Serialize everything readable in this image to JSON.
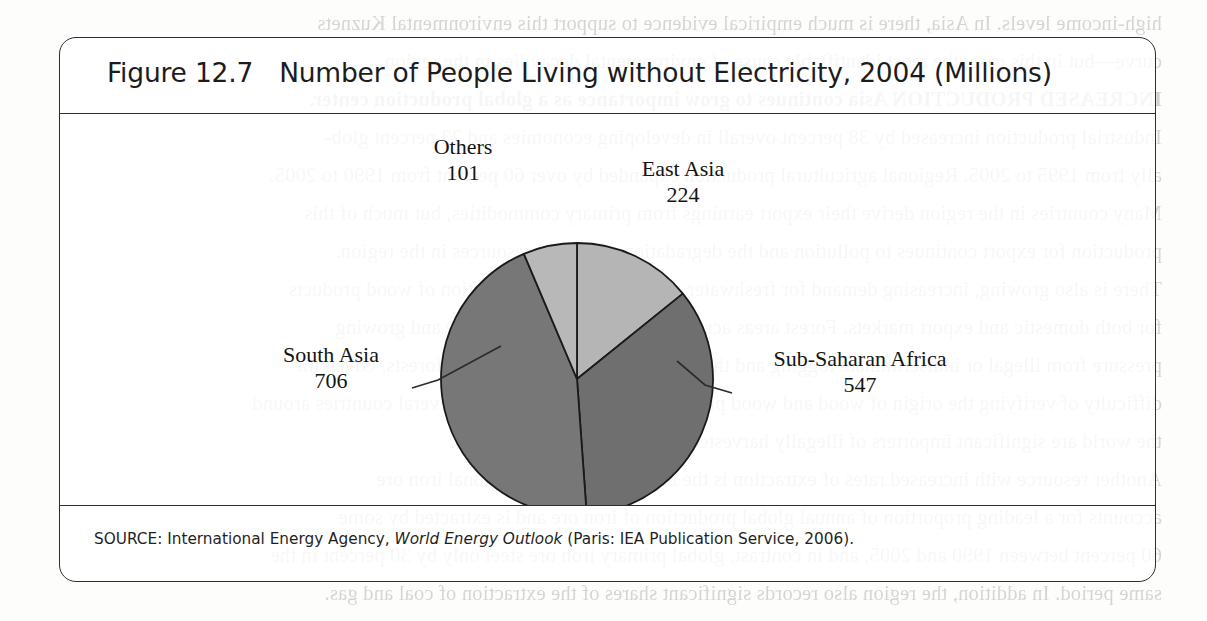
{
  "figure": {
    "number": "Figure 12.7",
    "title": "Number of People Living without Electricity, 2004 (Millions)",
    "source_prefix": "SOURCE: International Energy Agency, ",
    "source_italic": "World Energy Outlook",
    "source_suffix": " (Paris: IEA Publication Service, 2006)."
  },
  "chart_data": {
    "type": "pie",
    "title": "Number of People Living without Electricity, 2004 (Millions)",
    "unit": "Millions of people",
    "categories": [
      "East Asia",
      "Sub-Saharan Africa",
      "South Asia",
      "Others"
    ],
    "values": [
      224,
      547,
      706,
      101
    ],
    "total": 1578,
    "start_angle_deg": 0,
    "direction": "clockwise",
    "legend": "none",
    "labels_position": "outside",
    "slices": [
      {
        "name": "East Asia",
        "label": "East Asia",
        "value": 224,
        "value_text": "224",
        "percent": 14.2,
        "color": "#b5b5b5",
        "start_deg": 0,
        "end_deg": 51.1
      },
      {
        "name": "Sub-Saharan Africa",
        "label": "Sub-Saharan Africa",
        "value": 547,
        "value_text": "547",
        "percent": 34.7,
        "color": "#6f6f6f",
        "start_deg": 51.1,
        "end_deg": 175.9
      },
      {
        "name": "South Asia",
        "label": "South Asia",
        "value": 706,
        "value_text": "706",
        "percent": 44.7,
        "color": "#777777",
        "start_deg": 175.9,
        "end_deg": 337.0
      },
      {
        "name": "Others",
        "label": "Others",
        "value": 101,
        "value_text": "101",
        "percent": 6.4,
        "color": "#b8b8b8",
        "start_deg": 337.0,
        "end_deg": 360
      }
    ],
    "colors": {
      "east_asia": "#b5b5b5",
      "sub_saharan_africa": "#6f6f6f",
      "south_asia": "#777777",
      "others": "#b8b8b8",
      "slice_outline": "#1a1a1a",
      "leader_line": "#2b2b2b"
    }
  },
  "page_bleed": {
    "lines": [
      "high-income levels. In Asia, there is much empirical evidence to support this environmental Kuznets",
      "curve—but in this case, the most identifiable cause of environmental decay lies in the region.",
      "INCREASED PRODUCTION  Asia continues to grow importance as a global production center.",
      "Industrial production increased by 38 percent overall in developing economies and 23 percent glob-",
      "ally from 1995 to 2005. Regional agricultural production expanded by over 60 percent from 1990 to 2005.",
      "Many countries in the region derive their export earnings from primary commodities, but much of this",
      "production for export continues to pollution and the degradation of natural resources in the region.",
      "There is also growing, increasing demand for freshwater resources and the production of wood products",
      "for both domestic and export markets. Forest areas across the region are under severe and growing",
      "pressure from illegal or indiscriminate logging and the clearing of land for plantation forests. Given the",
      "difficulty of verifying the origin of wood and wood products, it is highly likely that several countries around",
      "the world are significant importers of illegally harvested timber and timber products.",
      "Another resource with increased rates of extraction is the region's minerals. Regional iron ore",
      "accounts for a leading proportion of annual global production of iron ore and is extracted by some",
      "60 percent between 1990 and 2005, and in contrast, global primary iron ore steel only by 30 percent in the",
      "same period. In addition, the region also records significant shares of the extraction of coal and gas."
    ]
  }
}
